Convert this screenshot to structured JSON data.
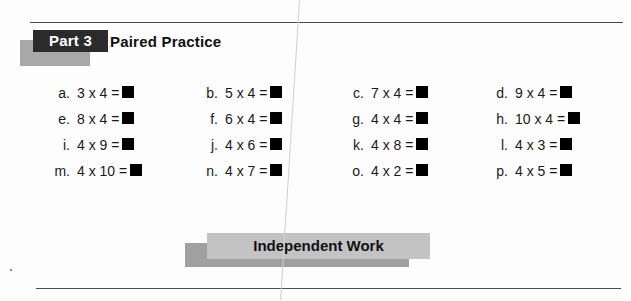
{
  "header": {
    "part_label": "Part 3",
    "section_title": "Paired Practice"
  },
  "problems": [
    [
      {
        "label": "a.",
        "expression": "3 x 4 ="
      },
      {
        "label": "b.",
        "expression": "5 x 4 ="
      },
      {
        "label": "c.",
        "expression": "7 x 4 ="
      },
      {
        "label": "d.",
        "expression": "9 x 4 ="
      }
    ],
    [
      {
        "label": "e.",
        "expression": "8 x 4 ="
      },
      {
        "label": "f.",
        "expression": "6 x 4 ="
      },
      {
        "label": "g.",
        "expression": "4 x 4 ="
      },
      {
        "label": "h.",
        "expression": "10 x 4 ="
      }
    ],
    [
      {
        "label": "i.",
        "expression": "4 x 9 ="
      },
      {
        "label": "j.",
        "expression": "4 x 6 ="
      },
      {
        "label": "k.",
        "expression": "4 x 8 ="
      },
      {
        "label": "l.",
        "expression": "4 x 3 ="
      }
    ],
    [
      {
        "label": "m.",
        "expression": "4 x 10 ="
      },
      {
        "label": "n.",
        "expression": "4 x 7 ="
      },
      {
        "label": "o.",
        "expression": "4 x 2 ="
      },
      {
        "label": "p.",
        "expression": "4 x 5 ="
      }
    ]
  ],
  "footer": {
    "independent_work_label": "Independent Work"
  },
  "colors": {
    "part_block": "#2b2b2b",
    "part_shadow": "#a8a8a8",
    "independent_block": "#c3c3c3",
    "independent_shadow": "#a0a0a0",
    "answer_box": "#000000",
    "rule": "#4a4a4a"
  }
}
